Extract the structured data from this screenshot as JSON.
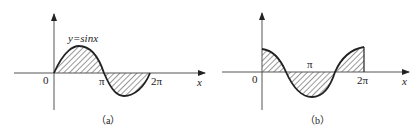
{
  "panel_a": {
    "caption": "（a）",
    "curve_label": "y=sinx",
    "origin_label": "0",
    "pi_label": "π",
    "two_pi_label": "2π",
    "x_axis_label": "x"
  },
  "panel_b": {
    "caption": "（b）",
    "origin_label": "0",
    "pi_label": "π",
    "two_pi_label": "2π",
    "x_axis_label": "x"
  },
  "colors": {
    "stroke": "#222222",
    "background": "#ffffff"
  }
}
